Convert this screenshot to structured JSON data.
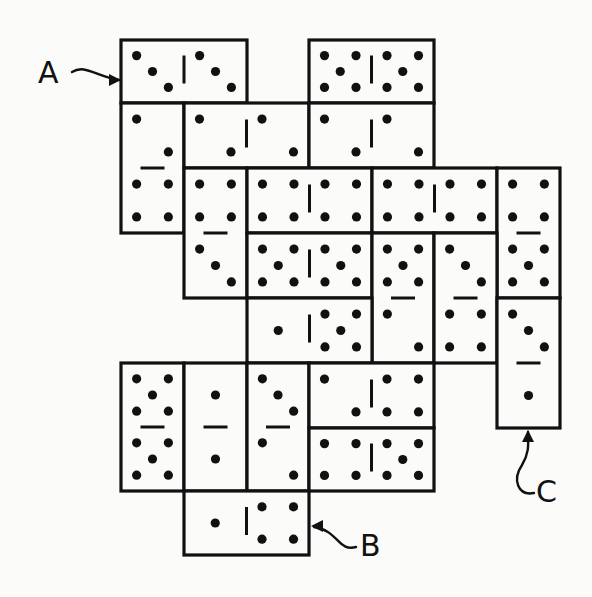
{
  "figure": {
    "width": 592,
    "height": 597,
    "ink_color": "#111111",
    "paper_color": "#fbfbf9",
    "grid": {
      "x_lines": [
        121,
        184,
        247,
        309,
        372,
        434,
        497,
        560
      ],
      "y_lines": [
        40,
        103,
        168,
        233,
        298,
        363,
        428,
        491,
        555
      ]
    }
  },
  "labels": [
    {
      "id": "A",
      "text": "A",
      "x": 38,
      "y": 83,
      "arrow": "M 72 72 C 85 64, 95 76, 119 80",
      "arrow_tip": [
        121,
        80
      ],
      "tip_dir": "right"
    },
    {
      "id": "B",
      "text": "B",
      "x": 360,
      "y": 556,
      "arrow": "M 356 547 C 338 552, 338 530, 314 527",
      "arrow_tip": [
        311,
        526
      ],
      "tip_dir": "left"
    },
    {
      "id": "C",
      "text": "C",
      "x": 536,
      "y": 502,
      "arrow": "M 534 493 C 518 496, 512 480, 522 465 C 530 452, 528 442, 528 432",
      "arrow_tip": [
        528,
        430
      ],
      "tip_dir": "up"
    }
  ],
  "dominoes": [
    {
      "id": "A",
      "orientation": "horizontal",
      "col": 0,
      "row": 0,
      "values": [
        3,
        3
      ],
      "label": "A"
    },
    {
      "id": "d2",
      "orientation": "horizontal",
      "col": 3,
      "row": 0,
      "values": [
        5,
        5
      ]
    },
    {
      "id": "d3",
      "orientation": "vertical",
      "col": 0,
      "row": 1,
      "values": [
        2,
        4
      ]
    },
    {
      "id": "d4",
      "orientation": "horizontal",
      "col": 1,
      "row": 1,
      "values": [
        2,
        2
      ]
    },
    {
      "id": "d5",
      "orientation": "horizontal",
      "col": 3,
      "row": 1,
      "values": [
        2,
        2
      ]
    },
    {
      "id": "d6",
      "orientation": "vertical",
      "col": 1,
      "row": 2,
      "values": [
        4,
        3
      ]
    },
    {
      "id": "d7",
      "orientation": "horizontal",
      "col": 2,
      "row": 2,
      "values": [
        4,
        4
      ]
    },
    {
      "id": "d8",
      "orientation": "horizontal",
      "col": 4,
      "row": 2,
      "values": [
        4,
        4
      ]
    },
    {
      "id": "d9",
      "orientation": "vertical",
      "col": 6,
      "row": 2,
      "values": [
        4,
        5
      ]
    },
    {
      "id": "d10",
      "orientation": "horizontal",
      "col": 2,
      "row": 3,
      "values": [
        5,
        5
      ]
    },
    {
      "id": "d11",
      "orientation": "vertical",
      "col": 4,
      "row": 3,
      "values": [
        5,
        2
      ]
    },
    {
      "id": "d12",
      "orientation": "vertical",
      "col": 5,
      "row": 3,
      "values": [
        3,
        4
      ]
    },
    {
      "id": "d13",
      "orientation": "horizontal",
      "col": 2,
      "row": 4,
      "values": [
        1,
        5
      ]
    },
    {
      "id": "C",
      "orientation": "vertical",
      "col": 6,
      "row": 4,
      "values": [
        3,
        1
      ],
      "label": "C"
    },
    {
      "id": "d15",
      "orientation": "vertical",
      "col": 0,
      "row": 5,
      "values": [
        5,
        5
      ]
    },
    {
      "id": "d16",
      "orientation": "vertical",
      "col": 1,
      "row": 5,
      "values": [
        1,
        1
      ]
    },
    {
      "id": "d17",
      "orientation": "vertical",
      "col": 2,
      "row": 5,
      "values": [
        3,
        2
      ]
    },
    {
      "id": "d18",
      "orientation": "horizontal",
      "col": 3,
      "row": 5,
      "values": [
        2,
        4
      ]
    },
    {
      "id": "d19",
      "orientation": "horizontal",
      "col": 3,
      "row": 6,
      "values": [
        4,
        5
      ]
    },
    {
      "id": "B",
      "orientation": "horizontal",
      "col": 1,
      "row": 7,
      "values": [
        1,
        4
      ],
      "label": "B"
    }
  ]
}
